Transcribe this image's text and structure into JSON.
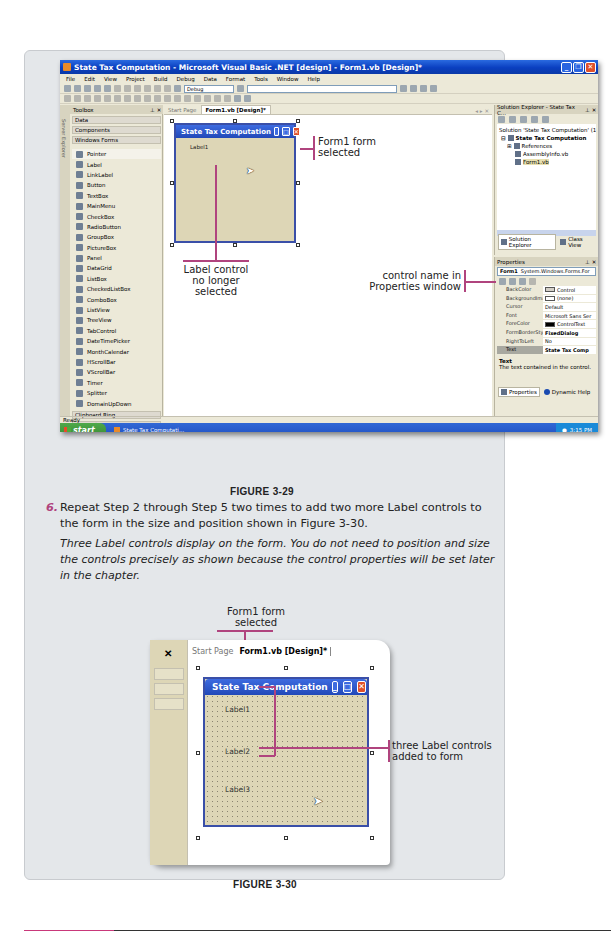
{
  "figure_3_29": {
    "window": {
      "title": "State Tax Computation - Microsoft Visual Basic .NET [design] - Form1.vb [Design]*",
      "buttons": [
        "minimize",
        "restore",
        "close"
      ]
    },
    "menu": [
      "File",
      "Edit",
      "View",
      "Project",
      "Build",
      "Debug",
      "Data",
      "Format",
      "Tools",
      "Window",
      "Help"
    ],
    "toolbar": {
      "config_combo": "Debug"
    },
    "toolbox": {
      "title": "Toolbox",
      "side_label": "Server Explorer",
      "categories_top": [
        "Data",
        "Components",
        "Windows Forms"
      ],
      "items": [
        "Pointer",
        "Label",
        "LinkLabel",
        "Button",
        "TextBox",
        "MainMenu",
        "CheckBox",
        "RadioButton",
        "GroupBox",
        "PictureBox",
        "Panel",
        "DataGrid",
        "ListBox",
        "CheckedListBox",
        "ComboBox",
        "ListView",
        "TreeView",
        "TabControl",
        "DateTimePicker",
        "MonthCalendar",
        "HScrollBar",
        "VScrollBar",
        "Timer",
        "Splitter",
        "DomainUpDown"
      ],
      "categories_bottom": [
        "Clipboard Ring",
        "General"
      ]
    },
    "document_tabs": [
      "Start Page",
      "Form1.vb [Design]*"
    ],
    "designer_form": {
      "title": "State Tax Computation",
      "label": "Label1"
    },
    "solution_explorer": {
      "title": "Solution Explorer - State Tax C...",
      "tree": [
        {
          "text": "Solution 'State Tax Computation' (1 p",
          "bold": false
        },
        {
          "text": "State Tax Computation",
          "bold": true
        },
        {
          "text": "References",
          "bold": false
        },
        {
          "text": "AssemblyInfo.vb",
          "bold": false
        },
        {
          "text": "Form1.vb",
          "bold": false,
          "selected": true
        }
      ],
      "tabs": [
        "Solution Explorer",
        "Class View"
      ]
    },
    "properties": {
      "title": "Properties",
      "object_combo": {
        "name": "Form1",
        "type": "System.Windows.Forms.For"
      },
      "rows": [
        {
          "key": "BackColor",
          "value": "Control",
          "swatch": "#d4d0c8"
        },
        {
          "key": "BackgroundImage",
          "value": "(none)",
          "swatch": "#ffffff"
        },
        {
          "key": "Cursor",
          "value": "Default"
        },
        {
          "key": "Font",
          "value": "Microsoft Sans Ser"
        },
        {
          "key": "ForeColor",
          "value": "ControlText",
          "swatch": "#000000"
        },
        {
          "key": "FormBorderStyle",
          "value": "FixedDialog",
          "bold": true
        },
        {
          "key": "RightToLeft",
          "value": "No"
        },
        {
          "key": "Text",
          "value": "State Tax Comp",
          "bold": true,
          "selected": true
        }
      ],
      "desc_title": "Text",
      "desc_text": "The text contained in the control.",
      "tabs": [
        "Properties",
        "Dynamic Help"
      ]
    },
    "status": "Ready",
    "taskbar": {
      "start": "start",
      "task": "State Tax Computati...",
      "clock": "3:15 PM"
    },
    "callouts": {
      "form_selected": [
        "Form1 form",
        "selected"
      ],
      "label_deselected": [
        "Label control",
        "no longer",
        "selected"
      ],
      "control_name": [
        "control name in",
        "Properties window"
      ]
    },
    "caption": "FIGURE 3-29"
  },
  "step6": {
    "number": "6.",
    "text": "Repeat Step 2 through Step 5 two times to add two more Label controls to the form in the size and position shown in Figure 3-30.",
    "result": "Three Label controls display on the form. You do not need to position and size the controls precisely as shown because the control properties will be set later in the chapter."
  },
  "figure_3_30": {
    "tabs": [
      "Start Page",
      "Form1.vb [Design]*"
    ],
    "form_title": "State Tax Computation",
    "labels": [
      "Label1",
      "Label2",
      "Label3"
    ],
    "callouts": {
      "form_selected": [
        "Form1 form",
        "selected"
      ],
      "labels_added": [
        "three Label controls",
        "added to form"
      ]
    },
    "caption": "FIGURE 3-30"
  },
  "colors": {
    "callout_line": "#b0447e",
    "xp_blue": "#0a3fc0",
    "form_bg": "#ddd6b6"
  }
}
